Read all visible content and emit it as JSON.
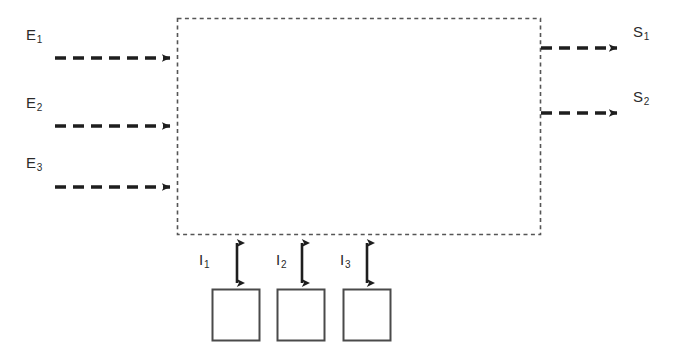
{
  "diagram": {
    "colors": {
      "line": "#2b2b2b",
      "dashed_border": "#555555",
      "box_border": "#4a4a4a",
      "background": "#ffffff",
      "text": "#2b2b2b"
    },
    "system_block": {
      "name": "system-boundary",
      "style": "dashed",
      "x": 177,
      "y": 18,
      "width": 364,
      "height": 217
    },
    "inputs": [
      {
        "id": "E1",
        "label": "E",
        "subscript": "1",
        "label_x": 26,
        "label_y": 27,
        "arrow_y": 58,
        "arrow_x1": 55,
        "arrow_x2": 177
      },
      {
        "id": "E2",
        "label": "E",
        "subscript": "2",
        "label_x": 26,
        "label_y": 95,
        "arrow_y": 126,
        "arrow_x1": 55,
        "arrow_x2": 177
      },
      {
        "id": "E3",
        "label": "E",
        "subscript": "3",
        "label_x": 26,
        "label_y": 155,
        "arrow_y": 187,
        "arrow_x1": 55,
        "arrow_x2": 177
      }
    ],
    "outputs": [
      {
        "id": "S1",
        "label": "S",
        "subscript": "1",
        "label_x": 633,
        "label_y": 24,
        "arrow_y": 48,
        "arrow_x1": 541,
        "arrow_x2": 623
      },
      {
        "id": "S2",
        "label": "S",
        "subscript": "2",
        "label_x": 633,
        "label_y": 89,
        "arrow_y": 113,
        "arrow_x1": 541,
        "arrow_x2": 623
      }
    ],
    "interfaces": [
      {
        "id": "I1",
        "label": "I",
        "subscript": "1",
        "label_x": 199,
        "label_y": 252,
        "arrow_x": 237,
        "arrow_y1": 236,
        "arrow_y2": 288,
        "box": {
          "x": 212,
          "y": 289,
          "width": 48,
          "height": 52
        }
      },
      {
        "id": "I2",
        "label": "I",
        "subscript": "2",
        "label_x": 276,
        "label_y": 252,
        "arrow_x": 302,
        "arrow_y1": 236,
        "arrow_y2": 288,
        "box": {
          "x": 277,
          "y": 289,
          "width": 48,
          "height": 52
        }
      },
      {
        "id": "I3",
        "label": "I",
        "subscript": "3",
        "label_x": 340,
        "label_y": 252,
        "arrow_x": 367,
        "arrow_y1": 236,
        "arrow_y2": 288,
        "box": {
          "x": 343,
          "y": 289,
          "width": 48,
          "height": 52
        }
      }
    ]
  }
}
